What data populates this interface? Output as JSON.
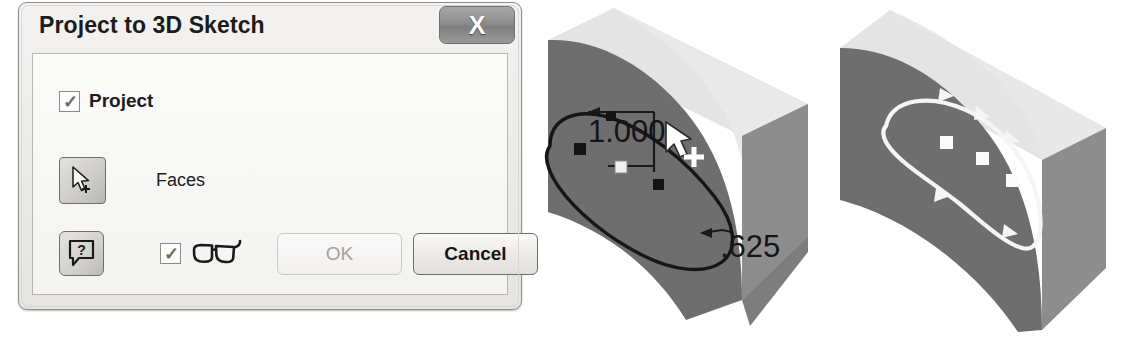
{
  "dialog": {
    "title": "Project to 3D Sketch",
    "close_label": "X",
    "close_icon": "close-icon",
    "project_checkbox": {
      "label": "Project",
      "checked": true,
      "tick": "✓"
    },
    "faces_row": {
      "label": "Faces",
      "icon": "arrow-cursor-select-icon"
    },
    "help_button": {
      "icon": "question-mark-help-icon",
      "glyph": "?"
    },
    "preview_row": {
      "checked": true,
      "tick": "✓",
      "icon": "eyeglasses-preview-icon"
    },
    "buttons": {
      "ok_label": "OK",
      "ok_enabled": false,
      "cancel_label": "Cancel",
      "cancel_enabled": true
    }
  },
  "models": {
    "left": {
      "name": "block-with-curved-cut-sketch-view",
      "dimensions": [
        {
          "value": "1.000",
          "name": "dimension-1000"
        },
        {
          "value": ".625",
          "name": "dimension-625"
        }
      ],
      "cursor": "arrow-cursor-with-crosshair",
      "curve_color": "#1a1a1a",
      "face_dark": "#6f6f6f",
      "face_light": "#e2e2e2",
      "face_mid": "#909090",
      "point_color": "#141414",
      "highlight_point_color": "#f2f2f2"
    },
    "right": {
      "name": "block-with-projected-3d-sketch-curve",
      "curve_color": "#f4f4f4",
      "face_dark": "#6f6f6f",
      "face_light": "#e2e2e2",
      "face_mid": "#909090",
      "point_color": "#fbfbfb"
    }
  }
}
